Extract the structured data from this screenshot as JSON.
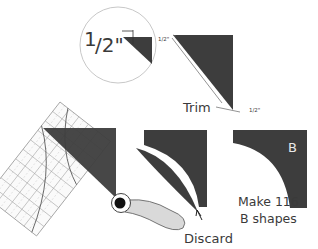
{
  "diagram": {
    "zoom_callout": {
      "fraction_numerator": "1",
      "fraction_rest": "/2\""
    },
    "trim_step": {
      "seam_label_top": "1/2\"",
      "seam_label_bottom": "1/2\"",
      "trim_label": "Trim"
    },
    "cut_step": {
      "discard_label": "Discard"
    },
    "result_step": {
      "shape_letter": "B",
      "instruction_line1": "Make 116",
      "instruction_line2": "B shapes"
    },
    "colors": {
      "fabric_dark": "#3d3d3d",
      "ruler_line": "#9a9a9a",
      "handle_fill": "#d9d9d9",
      "text": "#3a3a3a"
    }
  }
}
